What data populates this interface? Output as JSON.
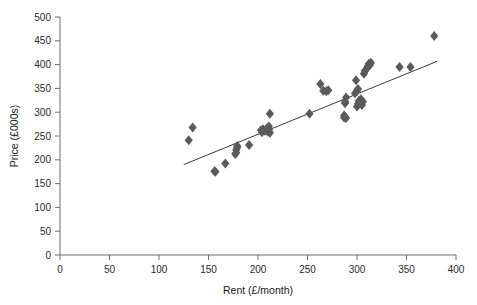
{
  "chart_data": {
    "type": "scatter",
    "title": "",
    "xlabel": "Rent (£/month)",
    "ylabel": "Price (£000s)",
    "xlim": [
      0,
      400
    ],
    "ylim": [
      0,
      500
    ],
    "xticks": [
      0,
      50,
      100,
      150,
      200,
      250,
      300,
      350,
      400
    ],
    "yticks": [
      0,
      50,
      100,
      150,
      200,
      250,
      300,
      350,
      400,
      450,
      500
    ],
    "grid": false,
    "legend": false,
    "marker": "diamond",
    "marker_color": "#5a5a5a",
    "marker_size": 5,
    "series": [
      {
        "name": "Rent vs Price",
        "points": [
          [
            130,
            241
          ],
          [
            134,
            268
          ],
          [
            156,
            176
          ],
          [
            157,
            175
          ],
          [
            167,
            192
          ],
          [
            177,
            212
          ],
          [
            178,
            215
          ],
          [
            178,
            221
          ],
          [
            179,
            226
          ],
          [
            179,
            229
          ],
          [
            191,
            231
          ],
          [
            203,
            262
          ],
          [
            204,
            258
          ],
          [
            205,
            264
          ],
          [
            207,
            261
          ],
          [
            209,
            266
          ],
          [
            210,
            259
          ],
          [
            211,
            263
          ],
          [
            211,
            270
          ],
          [
            212,
            257
          ],
          [
            212,
            297
          ],
          [
            252,
            297
          ],
          [
            263,
            359
          ],
          [
            266,
            345
          ],
          [
            269,
            344
          ],
          [
            271,
            346
          ],
          [
            287,
            289
          ],
          [
            287,
            293
          ],
          [
            288,
            319
          ],
          [
            288,
            322
          ],
          [
            289,
            288
          ],
          [
            289,
            331
          ],
          [
            298,
            340
          ],
          [
            299,
            367
          ],
          [
            300,
            312
          ],
          [
            300,
            345
          ],
          [
            301,
            318
          ],
          [
            301,
            349
          ],
          [
            302,
            324
          ],
          [
            303,
            320
          ],
          [
            304,
            327
          ],
          [
            305,
            315
          ],
          [
            306,
            322
          ],
          [
            307,
            381
          ],
          [
            308,
            387
          ],
          [
            310,
            392
          ],
          [
            311,
            397
          ],
          [
            312,
            402
          ],
          [
            313,
            399
          ],
          [
            314,
            404
          ],
          [
            343,
            395
          ],
          [
            354,
            395
          ],
          [
            378,
            460
          ]
        ]
      }
    ],
    "trendline": {
      "label": "linear fit",
      "color": "#3a3a3a",
      "x_start": 125,
      "y_start": 190,
      "x_end": 381,
      "y_end": 407
    }
  },
  "axes": {
    "x_tick_labels": [
      "0",
      "50",
      "100",
      "150",
      "200",
      "250",
      "300",
      "350",
      "400"
    ],
    "y_tick_labels": [
      "0",
      "50",
      "100",
      "150",
      "200",
      "250",
      "300",
      "350",
      "400",
      "450",
      "500"
    ],
    "x_axis_title": "Rent (£/month)",
    "y_axis_title": "Price (£000s)"
  },
  "style": {
    "axis_color": "#6e6e6e",
    "background": "#ffffff",
    "text_color": "#2b2b2b"
  }
}
